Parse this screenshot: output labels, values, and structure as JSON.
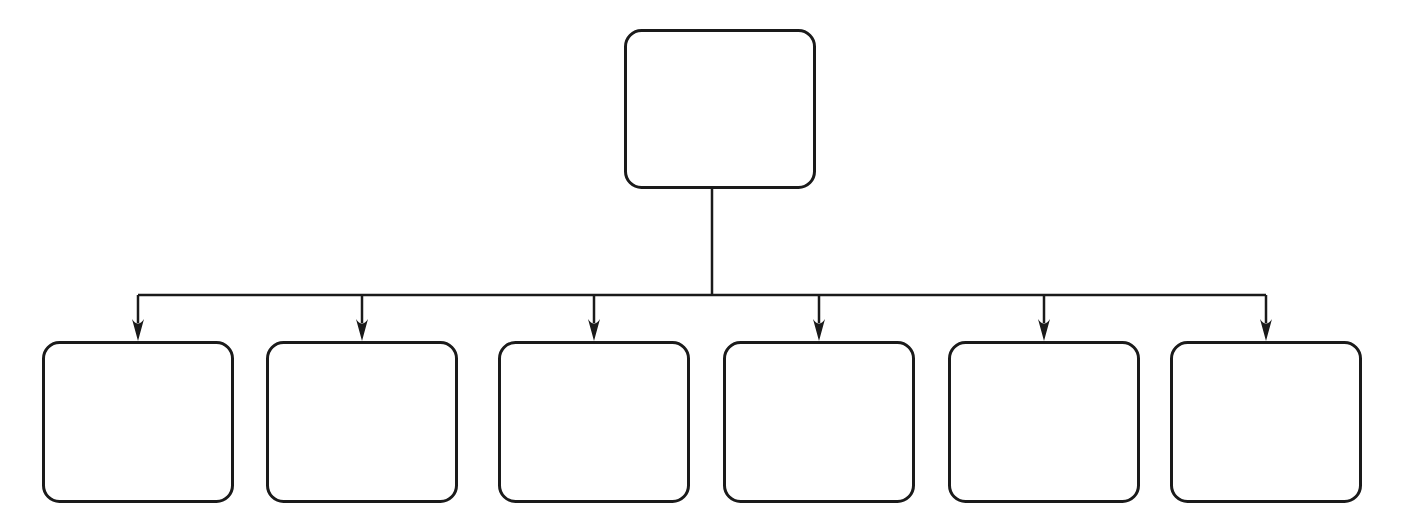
{
  "diagram": {
    "type": "org-tree",
    "orientation": "top-down",
    "canvas": {
      "width": 1404,
      "height": 524,
      "background": "#ffffff"
    },
    "style": {
      "stroke_color": "#1a1a1a",
      "node_fill": "#ffffff",
      "stroke_width": 3,
      "connector_width": 2.5,
      "corner_radius": 16
    },
    "root": {
      "id": "root-node",
      "label": "",
      "x": 624,
      "y": 29,
      "width": 192,
      "height": 160
    },
    "bus": {
      "stem_x": 712,
      "stem_top": 189,
      "stem_bottom": 295,
      "rail_y": 295,
      "rail_left": 138,
      "rail_right": 1266,
      "drop_bottom": 341
    },
    "children": [
      {
        "id": "child-node-1",
        "label": "",
        "x": 42,
        "y": 341,
        "width": 192,
        "height": 162,
        "arrow_x": 138
      },
      {
        "id": "child-node-2",
        "label": "",
        "x": 266,
        "y": 341,
        "width": 192,
        "height": 162,
        "arrow_x": 362
      },
      {
        "id": "child-node-3",
        "label": "",
        "x": 498,
        "y": 341,
        "width": 192,
        "height": 162,
        "arrow_x": 594
      },
      {
        "id": "child-node-4",
        "label": "",
        "x": 723,
        "y": 341,
        "width": 192,
        "height": 162,
        "arrow_x": 819
      },
      {
        "id": "child-node-5",
        "label": "",
        "x": 948,
        "y": 341,
        "width": 192,
        "height": 162,
        "arrow_x": 1044
      },
      {
        "id": "child-node-6",
        "label": "",
        "x": 1170,
        "y": 341,
        "width": 192,
        "height": 162,
        "arrow_x": 1266
      }
    ],
    "arrow": {
      "half_width": 6,
      "length": 22
    }
  }
}
